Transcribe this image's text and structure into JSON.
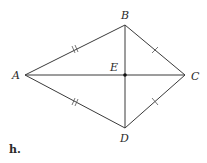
{
  "figure": {
    "caption": "h.",
    "colors": {
      "line": "#3a3a3a",
      "tick": "#555555",
      "text": "#2a2a2a",
      "background": "#ffffff"
    }
  },
  "points": {
    "A": {
      "label": "A",
      "x": 25,
      "y": 75
    },
    "B": {
      "label": "B",
      "x": 125,
      "y": 25
    },
    "C": {
      "label": "C",
      "x": 185,
      "y": 75
    },
    "D": {
      "label": "D",
      "x": 125,
      "y": 128
    },
    "E": {
      "label": "E",
      "x": 125,
      "y": 75
    }
  },
  "segments": [
    {
      "from": "A",
      "to": "B",
      "ticks": 2
    },
    {
      "from": "B",
      "to": "C",
      "ticks": 1
    },
    {
      "from": "C",
      "to": "D",
      "ticks": 1
    },
    {
      "from": "D",
      "to": "A",
      "ticks": 2
    },
    {
      "from": "A",
      "to": "C",
      "ticks": 0
    },
    {
      "from": "B",
      "to": "D",
      "ticks": 0
    }
  ],
  "labels": {
    "A": "A",
    "B": "B",
    "C": "C",
    "D": "D",
    "E": "E"
  }
}
